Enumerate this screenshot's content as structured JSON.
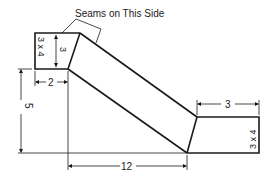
{
  "diagram": {
    "callout": {
      "label": "Seams on This Side"
    },
    "left_end": {
      "size_label": "3 x 4",
      "height_dim": "3"
    },
    "right_end": {
      "size_label": "3 x 4",
      "width_dim": "3"
    },
    "dimensions": {
      "left_offset": "2",
      "rise": "5",
      "run": "12",
      "right_length": "3"
    },
    "colors": {
      "line": "#1a1a1a",
      "background": "#ffffff"
    }
  }
}
